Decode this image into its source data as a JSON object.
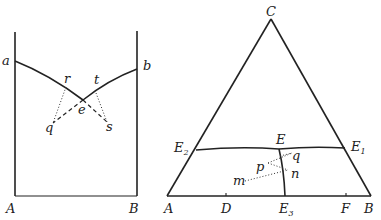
{
  "left_diagram": {
    "labels": {
      "a": "a",
      "b": "b",
      "r": "r",
      "t": "t",
      "e": "e",
      "q": "q",
      "s": "s",
      "A": "A",
      "B": "B"
    }
  },
  "right_diagram": {
    "labels": {
      "C": "C",
      "E": "E",
      "E2": "E",
      "E2_sub": "2",
      "E1": "E",
      "E1_sub": "1",
      "p": "p",
      "q": "q",
      "n": "n",
      "m": "m",
      "A": "A",
      "D": "D",
      "E3": "E",
      "E3_sub": "3",
      "F": "F",
      "B": "B"
    }
  }
}
